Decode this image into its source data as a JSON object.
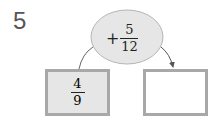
{
  "problem": {
    "number": "5",
    "operation": {
      "operator": "+",
      "numerator": "5",
      "denominator": "12"
    },
    "start_box": {
      "numerator": "4",
      "denominator": "9"
    },
    "result_box": {
      "value": ""
    }
  }
}
